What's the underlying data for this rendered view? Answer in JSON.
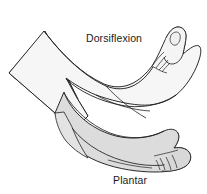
{
  "figure": {
    "background_color": "#ffffff",
    "line_color": "#231f20",
    "labels": {
      "dorsiflexion": "Dorsiflexion",
      "plantar_line1": "Plantar",
      "plantar_line2": "flexion"
    },
    "fills": {
      "leg_shaft": "#ececec",
      "dorsiflexed_foot": "#f4f4f4",
      "plantarflexed_foot": "#dcdcdc",
      "heel_wedge": "#e6e6e6",
      "toe_nail": "#efefef"
    }
  }
}
